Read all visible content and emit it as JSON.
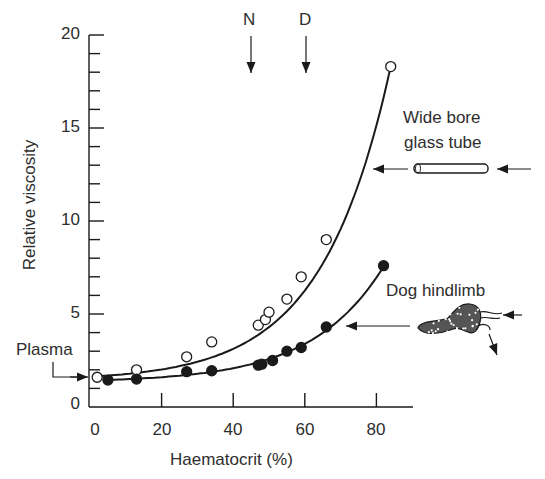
{
  "chart_data": {
    "type": "scatter",
    "title": "",
    "xlabel": "Haematocrit (%)",
    "ylabel": "Relative viscosity",
    "xlim": [
      0,
      90
    ],
    "ylim": [
      0,
      20
    ],
    "x_ticks": [
      0,
      20,
      40,
      60,
      80
    ],
    "y_ticks": [
      0,
      5,
      10,
      15,
      20
    ],
    "y_minor_step": 1,
    "grid": false,
    "series": [
      {
        "name": "Wide bore glass tube",
        "marker": "open-circle",
        "x": [
          2,
          13,
          27,
          34,
          47,
          49,
          50,
          55,
          59,
          66,
          84
        ],
        "y": [
          1.6,
          2.0,
          2.7,
          3.5,
          4.4,
          4.7,
          5.1,
          5.8,
          7.0,
          9.0,
          18.3
        ]
      },
      {
        "name": "Dog hindlimb",
        "marker": "filled-circle",
        "x": [
          5,
          13,
          27,
          34,
          47,
          48,
          51,
          55,
          59,
          66,
          82
        ],
        "y": [
          1.45,
          1.5,
          1.9,
          1.95,
          2.25,
          2.3,
          2.5,
          3.0,
          3.2,
          4.3,
          7.6
        ]
      }
    ],
    "annotations": [
      {
        "text": "N",
        "x": 45,
        "type": "down-arrow"
      },
      {
        "text": "D",
        "x": 60,
        "type": "down-arrow"
      },
      {
        "text": "Plasma",
        "y": 1.6,
        "type": "arrow-to-axis"
      },
      {
        "text": "Wide bore glass tube",
        "type": "label-with-arrow"
      },
      {
        "text": "Dog hindlimb",
        "type": "label-with-arrow"
      }
    ]
  },
  "labels": {
    "xlabel": "Haematocrit (%)",
    "ylabel": "Relative viscosity",
    "n": "N",
    "d": "D",
    "plasma": "Plasma",
    "tube_line1": "Wide bore",
    "tube_line2": "glass tube",
    "hindlimb": "Dog hindlimb"
  },
  "ticks": {
    "y": [
      "20",
      "15",
      "10",
      "5",
      "0"
    ],
    "x": [
      "0",
      "20",
      "40",
      "60",
      "80"
    ]
  },
  "colors": {
    "ink": "#1a1a1a",
    "background": "#ffffff"
  }
}
